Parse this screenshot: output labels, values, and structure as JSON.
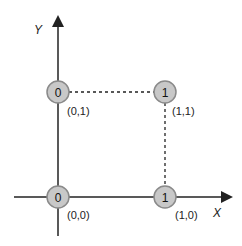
{
  "diagram": {
    "axes": {
      "x_label": "X",
      "y_label": "Y"
    },
    "nodes": [
      {
        "value": "0",
        "coord": "(0,1)",
        "cx": 58,
        "cy": 92
      },
      {
        "value": "1",
        "coord": "(1,1)",
        "cx": 165,
        "cy": 92
      },
      {
        "value": "0",
        "coord": "(0,0)",
        "cx": 58,
        "cy": 197
      },
      {
        "value": "1",
        "coord": "(1,0)",
        "cx": 165,
        "cy": 197
      }
    ],
    "colors": {
      "node_fill": "#c8c8c8",
      "node_stroke": "#8a8a8a",
      "line": "#222222"
    }
  }
}
